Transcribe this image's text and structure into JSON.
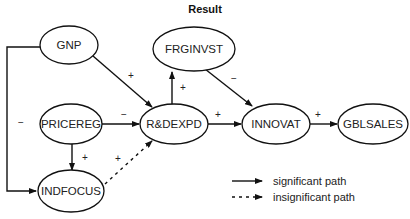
{
  "title": "Result",
  "nodes": {
    "gnp": "GNP",
    "frginvst": "FRGINVST",
    "pricereg": "PRICEREG",
    "rdexpd": "R&DEXPD",
    "innovat": "INNOVAT",
    "gblsales": "GBLSALES",
    "indfocus": "INDFOCUS"
  },
  "edges": [
    {
      "from": "GNP",
      "to": "R&DEXPD",
      "sign": "+",
      "type": "significant"
    },
    {
      "from": "GNP",
      "to": "INDFOCUS",
      "sign": "−",
      "type": "significant"
    },
    {
      "from": "R&DEXPD",
      "to": "FRGINVST",
      "sign": "+",
      "type": "significant"
    },
    {
      "from": "FRGINVST",
      "to": "INNOVAT",
      "sign": "−",
      "type": "significant"
    },
    {
      "from": "PRICEREG",
      "to": "R&DEXPD",
      "sign": "−",
      "type": "significant"
    },
    {
      "from": "PRICEREG",
      "to": "INDFOCUS",
      "sign": "+",
      "type": "significant"
    },
    {
      "from": "INDFOCUS",
      "to": "R&DEXPD",
      "sign": "+",
      "type": "insignificant"
    },
    {
      "from": "R&DEXPD",
      "to": "INNOVAT",
      "sign": "+",
      "type": "significant"
    },
    {
      "from": "INNOVAT",
      "to": "GBLSALES",
      "sign": "+",
      "type": "significant"
    }
  ],
  "signs": {
    "gnp_rd": "+",
    "gnp_indfocus": "−",
    "rd_frginvst": "+",
    "frginvst_innovat": "−",
    "pricereg_rd": "−",
    "pricereg_indfocus": "+",
    "indfocus_rd": "+",
    "rd_innovat": "+",
    "innovat_gblsales": "+"
  },
  "legend": {
    "significant": "significant path",
    "insignificant": "insignificant path"
  }
}
